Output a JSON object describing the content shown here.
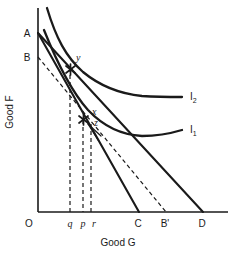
{
  "figure": {
    "type": "indifference-curve-diagram",
    "axes": {
      "x_label": "Good G",
      "y_label": "Good F",
      "origin_label": "O"
    },
    "y_axis_points": [
      {
        "id": "A",
        "label": "A"
      },
      {
        "id": "B",
        "label": "B"
      }
    ],
    "x_axis_points": [
      {
        "id": "q",
        "label": "q"
      },
      {
        "id": "p",
        "label": "p"
      },
      {
        "id": "r",
        "label": "r"
      },
      {
        "id": "C",
        "label": "C"
      },
      {
        "id": "Bprime",
        "label": "B'"
      },
      {
        "id": "D",
        "label": "D"
      }
    ],
    "equilibrium_points": [
      {
        "id": "y",
        "label": "y"
      },
      {
        "id": "x",
        "label": "x"
      },
      {
        "id": "z",
        "label": "z"
      }
    ],
    "curves": [
      {
        "id": "I2",
        "label": "I",
        "subscript": "2"
      },
      {
        "id": "I1",
        "label": "I",
        "subscript": "1"
      }
    ],
    "colors": {
      "line": "#1a1a1a",
      "background": "#ffffff"
    }
  }
}
